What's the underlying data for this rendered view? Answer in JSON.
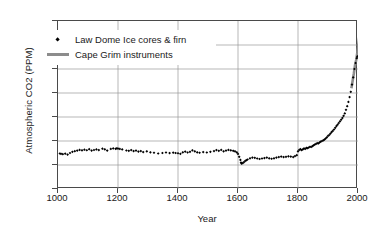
{
  "chart_data": {
    "type": "scatter",
    "title": "",
    "xlabel": "Year",
    "ylabel": "Atmospheric CO2 (PPM)",
    "xlim": [
      1000,
      2000
    ],
    "ylim": [
      250,
      390
    ],
    "xticks": [
      1000,
      1200,
      1400,
      1600,
      1800,
      2000
    ],
    "yticks": [
      250,
      270,
      290,
      310,
      330,
      350,
      370,
      390
    ],
    "grid": true,
    "legend_position": "upper-left",
    "series": [
      {
        "name": "Law Dome Ice cores & firn",
        "type": "scatter",
        "marker": "diamond",
        "color": "#000000",
        "points": [
          [
            1006,
            279.6
          ],
          [
            1010,
            279.3
          ],
          [
            1016,
            279.0
          ],
          [
            1024,
            279.4
          ],
          [
            1032,
            278.7
          ],
          [
            1040,
            280.0
          ],
          [
            1048,
            281.0
          ],
          [
            1056,
            281.5
          ],
          [
            1064,
            282.0
          ],
          [
            1072,
            282.6
          ],
          [
            1080,
            282.2
          ],
          [
            1088,
            282.8
          ],
          [
            1096,
            282.3
          ],
          [
            1104,
            283.2
          ],
          [
            1112,
            282.0
          ],
          [
            1120,
            282.5
          ],
          [
            1128,
            283.0
          ],
          [
            1136,
            282.4
          ],
          [
            1148,
            283.6
          ],
          [
            1156,
            283.1
          ],
          [
            1164,
            282.0
          ],
          [
            1176,
            283.4
          ],
          [
            1184,
            283.8
          ],
          [
            1192,
            283.5
          ],
          [
            1196,
            283.9
          ],
          [
            1200,
            283.7
          ],
          [
            1206,
            283.4
          ],
          [
            1214,
            283.0
          ],
          [
            1228,
            282.1
          ],
          [
            1236,
            281.8
          ],
          [
            1244,
            282.4
          ],
          [
            1252,
            281.6
          ],
          [
            1260,
            282.0
          ],
          [
            1268,
            281.2
          ],
          [
            1276,
            281.6
          ],
          [
            1284,
            280.8
          ],
          [
            1296,
            281.4
          ],
          [
            1308,
            280.6
          ],
          [
            1320,
            280.2
          ],
          [
            1334,
            279.6
          ],
          [
            1348,
            280.0
          ],
          [
            1360,
            280.4
          ],
          [
            1372,
            279.9
          ],
          [
            1384,
            280.3
          ],
          [
            1392,
            280.0
          ],
          [
            1400,
            279.8
          ],
          [
            1408,
            279.3
          ],
          [
            1416,
            280.6
          ],
          [
            1424,
            281.2
          ],
          [
            1432,
            280.4
          ],
          [
            1440,
            281.0
          ],
          [
            1448,
            282.2
          ],
          [
            1456,
            281.4
          ],
          [
            1464,
            280.6
          ],
          [
            1472,
            280.2
          ],
          [
            1484,
            280.8
          ],
          [
            1496,
            280.4
          ],
          [
            1508,
            281.0
          ],
          [
            1520,
            281.6
          ],
          [
            1528,
            282.4
          ],
          [
            1536,
            281.8
          ],
          [
            1544,
            282.6
          ],
          [
            1552,
            281.4
          ],
          [
            1560,
            282.0
          ],
          [
            1568,
            282.6
          ],
          [
            1576,
            282.2
          ],
          [
            1584,
            281.8
          ],
          [
            1590,
            281.4
          ],
          [
            1596,
            280.6
          ],
          [
            1600,
            279.2
          ],
          [
            1604,
            276.8
          ],
          [
            1608,
            274.2
          ],
          [
            1610,
            272.0
          ],
          [
            1612,
            271.2
          ],
          [
            1616,
            271.6
          ],
          [
            1620,
            272.4
          ],
          [
            1624,
            273.4
          ],
          [
            1628,
            274.0
          ],
          [
            1632,
            274.6
          ],
          [
            1640,
            275.6
          ],
          [
            1648,
            276.2
          ],
          [
            1656,
            276.0
          ],
          [
            1664,
            275.4
          ],
          [
            1672,
            275.0
          ],
          [
            1680,
            275.4
          ],
          [
            1688,
            275.8
          ],
          [
            1696,
            276.2
          ],
          [
            1704,
            275.6
          ],
          [
            1712,
            275.2
          ],
          [
            1720,
            275.6
          ],
          [
            1728,
            276.2
          ],
          [
            1736,
            276.6
          ],
          [
            1744,
            277.0
          ],
          [
            1752,
            276.6
          ],
          [
            1760,
            276.8
          ],
          [
            1768,
            277.2
          ],
          [
            1776,
            277.0
          ],
          [
            1784,
            276.6
          ],
          [
            1790,
            277.4
          ],
          [
            1796,
            278.2
          ],
          [
            1800,
            281.4
          ],
          [
            1804,
            282.6
          ],
          [
            1808,
            283.2
          ],
          [
            1812,
            282.4
          ],
          [
            1816,
            283.0
          ],
          [
            1820,
            283.8
          ],
          [
            1824,
            283.4
          ],
          [
            1828,
            284.2
          ],
          [
            1832,
            284.0
          ],
          [
            1836,
            284.6
          ],
          [
            1840,
            285.2
          ],
          [
            1844,
            285.0
          ],
          [
            1848,
            285.8
          ],
          [
            1852,
            286.4
          ],
          [
            1856,
            287.0
          ],
          [
            1860,
            287.6
          ],
          [
            1864,
            288.2
          ],
          [
            1868,
            288.0
          ],
          [
            1872,
            288.8
          ],
          [
            1876,
            289.4
          ],
          [
            1880,
            290.0
          ],
          [
            1884,
            290.6
          ],
          [
            1888,
            291.2
          ],
          [
            1892,
            292.0
          ],
          [
            1896,
            293.0
          ],
          [
            1900,
            294.2
          ],
          [
            1904,
            295.0
          ],
          [
            1908,
            296.2
          ],
          [
            1912,
            297.4
          ],
          [
            1916,
            298.4
          ],
          [
            1920,
            299.6
          ],
          [
            1924,
            301.0
          ],
          [
            1928,
            302.4
          ],
          [
            1932,
            303.6
          ],
          [
            1936,
            305.0
          ],
          [
            1940,
            306.4
          ],
          [
            1944,
            307.8
          ],
          [
            1948,
            309.2
          ],
          [
            1952,
            311.0
          ],
          [
            1956,
            313.0
          ],
          [
            1960,
            316.0
          ],
          [
            1964,
            319.0
          ],
          [
            1968,
            322.6
          ],
          [
            1972,
            326.6
          ],
          [
            1976,
            331.0
          ],
          [
            1980,
            337.0
          ],
          [
            1984,
            343.0
          ],
          [
            1988,
            350.0
          ],
          [
            1992,
            355.0
          ],
          [
            1996,
            359.0
          ],
          [
            1998,
            360.5
          ]
        ]
      },
      {
        "name": "Cape Grim instruments",
        "type": "line",
        "color": "#8c8c8c",
        "points": [
          [
            1978,
            334.0
          ],
          [
            1982,
            340.0
          ],
          [
            1986,
            346.0
          ],
          [
            1990,
            353.0
          ],
          [
            1994,
            357.5
          ],
          [
            1998,
            364.0
          ],
          [
            2002,
            372.0
          ],
          [
            2005,
            378.0
          ]
        ]
      }
    ]
  },
  "legend": {
    "items": [
      {
        "label": "Law Dome Ice cores & firn",
        "marker": "diamond-marker"
      },
      {
        "label": "Cape Grim instruments",
        "marker": "line-swatch"
      }
    ]
  }
}
